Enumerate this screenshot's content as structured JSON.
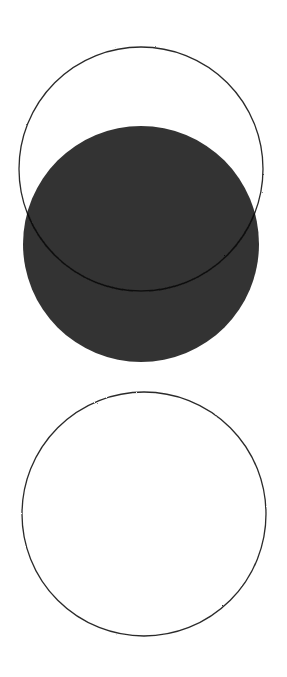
{
  "canvas": {
    "width": 287,
    "height": 677,
    "background": "#ffffff"
  },
  "colors": {
    "fill": "#333333",
    "stroke": "#2a2a2a"
  },
  "shapes": {
    "upper_outline_circle": {
      "cx": 141,
      "cy": 169,
      "r": 122
    },
    "filled_circle": {
      "cx": 141,
      "cy": 244,
      "r": 118
    },
    "inner_arc": {
      "cx": 141,
      "cy": 169,
      "r": 122
    },
    "lower_outline_circle": {
      "cx": 144,
      "cy": 514,
      "r": 122
    },
    "stem_line": {
      "x1": 141,
      "y1": 362,
      "x2": 141,
      "y2": 517
    }
  }
}
